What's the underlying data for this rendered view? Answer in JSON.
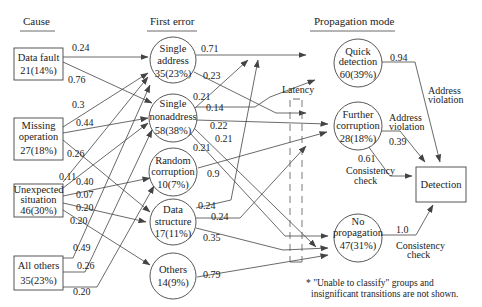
{
  "headers": {
    "cause": "Cause",
    "first_error": "First error",
    "propagation": "Propagation mode"
  },
  "causes": [
    {
      "line1": "Data fault",
      "line2": "21(14%)"
    },
    {
      "line1": "Missing",
      "line2": "operation",
      "line3": "27(18%)"
    },
    {
      "line1": "Unexpected",
      "line2": "situation",
      "line3": "46(30%)"
    },
    {
      "line1": "All others",
      "line2": "35(23%)"
    }
  ],
  "first_errors": [
    {
      "line1": "Single",
      "line2": "address",
      "line3": "35(23%)"
    },
    {
      "line1": "Single",
      "line2": "nonaddress",
      "line3": "58(38%)"
    },
    {
      "line1": "Random",
      "line2": "corruption",
      "line3": "10(7%)"
    },
    {
      "line1": "Data",
      "line2": "structure",
      "line3": "17(11%)"
    },
    {
      "line1": "Others",
      "line2": "14(9%)"
    }
  ],
  "propagation": [
    {
      "line1": "Quick",
      "line2": "detection",
      "line3": "60(39%)"
    },
    {
      "line1": "Further",
      "line2": "corruption",
      "line3": "28(18%)"
    },
    {
      "line1": "No",
      "line2": "propagation",
      "line3": "47(31%)"
    }
  ],
  "detection": "Detection",
  "latency": "Latency",
  "edge_labels": {
    "df_sa": "0.24",
    "df_sn": "0.76",
    "mo_sa": "0.3",
    "mo_sn": "0.44",
    "mo_ds": "0.26",
    "us_sa": "0.11",
    "us_sn": "0.40",
    "us_rc": "0.07",
    "us_ds": "0.20",
    "us_ot": "0.20",
    "ao_sa": "0.49",
    "ao_sn": "0.26",
    "ao_rc": "0.20",
    "sa_qd": "0.71",
    "sa_fc": "0.23",
    "sn_qd": "0.21",
    "sn_fc1": "0.14",
    "sn_fc2": "0.22",
    "sn_np1": "0.21",
    "sn_np2": "0.21",
    "rc_fc": "0.9",
    "ds_qd": "0.24",
    "ds_fc": "0.24",
    "ds_np": "0.35",
    "ot_np": "0.79",
    "qd_det": "0.94",
    "qd_det_label1": "Address",
    "qd_det_label2": "violation",
    "fc_det_addr": "0.39",
    "fc_addr1": "Address",
    "fc_addr2": "violation",
    "fc_det_cons": "0.61",
    "fc_cons1": "Consistency",
    "fc_cons2": "check",
    "np_det": "1.0",
    "np_cons1": "Consistency",
    "np_cons2": "check"
  },
  "footnote": {
    "line1": "* \"Unable to classify\" groups and",
    "line2": "insignificant transitions are not shown."
  }
}
